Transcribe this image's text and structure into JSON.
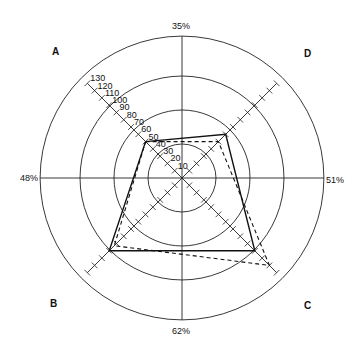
{
  "chart_data": {
    "type": "radar",
    "title": "",
    "center": [
      182,
      178
    ],
    "px_per_unit": 1.03,
    "rings": [
      33,
      66,
      99,
      132
    ],
    "axis_max": 130,
    "tick_step": 10,
    "tick_labels": [
      "10",
      "20",
      "30",
      "40",
      "50",
      "60",
      "70",
      "80",
      "90",
      "100",
      "110",
      "120",
      "130"
    ],
    "axes": [
      {
        "name": "A",
        "angle_deg": 135,
        "label": "A"
      },
      {
        "name": "D",
        "angle_deg": 45,
        "label": "D"
      },
      {
        "name": "C",
        "angle_deg": -45,
        "label": "C"
      },
      {
        "name": "B",
        "angle_deg": -135,
        "label": "B"
      }
    ],
    "edge_labels": {
      "top": "35%",
      "right": "51%",
      "bottom": "62%",
      "left": "48%"
    },
    "series": [
      {
        "name": "solid",
        "style": "solid",
        "values": {
          "A": 50,
          "D": 60,
          "C": 100,
          "B": 100
        }
      },
      {
        "name": "dashed",
        "style": "dashed",
        "values": {
          "A": 50,
          "D": 50,
          "C": 120,
          "B": 93
        }
      }
    ],
    "grid": true,
    "legend": null
  }
}
